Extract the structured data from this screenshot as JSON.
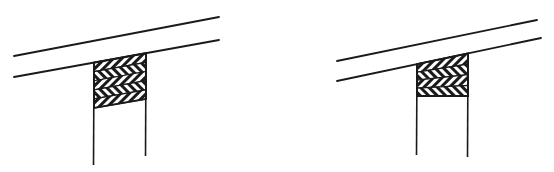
{
  "figure": {
    "width": 554,
    "height": 172,
    "background": "#ffffff",
    "ink": "#1a1a1a",
    "panels": [
      {
        "id": "left",
        "beam_top": [
          [
            14,
            56
          ],
          [
            219,
            17
          ]
        ],
        "beam_bottom": [
          [
            14,
            77
          ],
          [
            219,
            40
          ]
        ],
        "post_left": {
          "x": 94,
          "y_top": 60,
          "y_bottom": 165
        },
        "post_right": {
          "x": 146,
          "y_top": 50,
          "y_bottom": 156
        },
        "block_bottom_y_left": 108,
        "block_bottom_y_right": 99,
        "hatch_bands": 5
      },
      {
        "id": "right",
        "beam_top": [
          [
            337,
            61
          ],
          [
            537,
            20
          ]
        ],
        "beam_bottom": [
          [
            337,
            81
          ],
          [
            541,
            38
          ]
        ],
        "post_left": {
          "x": 417,
          "y_top": 65,
          "y_bottom": 155
        },
        "post_right": {
          "x": 468,
          "y_top": 53,
          "y_bottom": 157
        },
        "block_bottom_y_left": 96,
        "block_bottom_y_right": 96,
        "hatch_bands": 4
      }
    ]
  }
}
